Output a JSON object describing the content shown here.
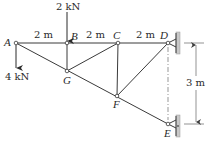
{
  "diagram": {
    "type": "truss",
    "nodes": [
      {
        "id": "A",
        "label": "A",
        "x": 16,
        "y": 43
      },
      {
        "id": "B",
        "label": "B",
        "x": 67,
        "y": 43
      },
      {
        "id": "C",
        "label": "C",
        "x": 118,
        "y": 43
      },
      {
        "id": "D",
        "label": "D",
        "x": 168,
        "y": 43
      },
      {
        "id": "G",
        "label": "G",
        "x": 67,
        "y": 71
      },
      {
        "id": "F",
        "label": "F",
        "x": 117,
        "y": 96
      },
      {
        "id": "E",
        "label": "E",
        "x": 168,
        "y": 124
      }
    ],
    "members": [
      [
        "A",
        "B"
      ],
      [
        "B",
        "C"
      ],
      [
        "C",
        "D"
      ],
      [
        "A",
        "G"
      ],
      [
        "G",
        "F"
      ],
      [
        "F",
        "E"
      ],
      [
        "B",
        "G"
      ],
      [
        "G",
        "C"
      ],
      [
        "C",
        "F"
      ],
      [
        "F",
        "D"
      ]
    ],
    "loads": [
      {
        "node": "B",
        "label": "2 kN",
        "direction": "down"
      },
      {
        "node": "A",
        "label": "4 kN",
        "direction": "down"
      }
    ],
    "supports": [
      {
        "node": "D",
        "type": "pin-to-wall"
      },
      {
        "node": "E",
        "type": "pin-to-wall"
      }
    ],
    "dimensions": {
      "spans": [
        {
          "from": "A",
          "to": "B",
          "label": "2 m"
        },
        {
          "from": "B",
          "to": "C",
          "label": "2 m"
        },
        {
          "from": "C",
          "to": "D",
          "label": "2 m"
        }
      ],
      "vertical": {
        "from": "D",
        "to": "E",
        "label": "3 m"
      }
    }
  }
}
